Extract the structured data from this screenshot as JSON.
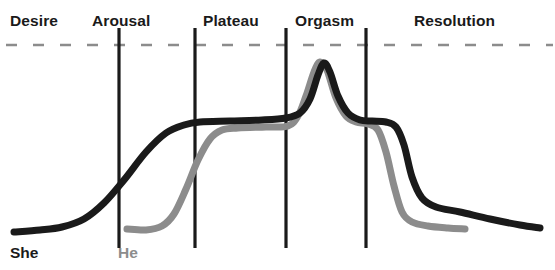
{
  "chart_data": {
    "type": "line",
    "title": "",
    "subtitle": "",
    "xlabel": "",
    "ylabel": "",
    "grid": false,
    "legend_position": "bottom-left",
    "phases": [
      {
        "name": "Desire",
        "label_x": 10,
        "label_y": 13,
        "boundary_x": null
      },
      {
        "name": "Arousal",
        "label_x": 92,
        "label_y": 13,
        "boundary_x": 119
      },
      {
        "name": "Plateau",
        "label_x": 203,
        "label_y": 13,
        "boundary_x": 195
      },
      {
        "name": "Orgasm",
        "label_x": 295,
        "label_y": 13,
        "boundary_x": 286
      },
      {
        "name": "Resolution",
        "label_x": 414,
        "label_y": 13,
        "boundary_x": 366
      }
    ],
    "dividers_x": [
      119,
      195,
      286,
      366
    ],
    "divider_top_y": 28,
    "divider_bottom_y": 248,
    "threshold_line": {
      "y": 45,
      "x_start": 6,
      "x_end": 553,
      "style": "dashed",
      "color": "#8c8c8c"
    },
    "series": [
      {
        "name": "She",
        "color": "#1a1a1a",
        "label_x": 10,
        "label_y": 245,
        "stroke_width": 7,
        "points": [
          [
            14,
            232
          ],
          [
            40,
            230
          ],
          [
            62,
            227
          ],
          [
            84,
            219
          ],
          [
            104,
            203
          ],
          [
            124,
            180
          ],
          [
            146,
            152
          ],
          [
            166,
            133
          ],
          [
            184,
            125
          ],
          [
            200,
            122
          ],
          [
            230,
            121
          ],
          [
            262,
            120
          ],
          [
            286,
            118
          ],
          [
            300,
            113
          ],
          [
            310,
            99
          ],
          [
            318,
            75
          ],
          [
            324,
            63
          ],
          [
            330,
            72
          ],
          [
            338,
            96
          ],
          [
            348,
            113
          ],
          [
            360,
            120
          ],
          [
            372,
            121
          ],
          [
            386,
            122
          ],
          [
            396,
            127
          ],
          [
            404,
            145
          ],
          [
            412,
            177
          ],
          [
            422,
            198
          ],
          [
            436,
            207
          ],
          [
            460,
            212
          ],
          [
            490,
            219
          ],
          [
            520,
            225
          ],
          [
            540,
            228
          ]
        ]
      },
      {
        "name": "He",
        "color": "#8c8c8c",
        "label_x": 118,
        "label_y": 245,
        "stroke_width": 7,
        "points": [
          [
            127,
            229
          ],
          [
            146,
            230
          ],
          [
            162,
            226
          ],
          [
            174,
            214
          ],
          [
            186,
            189
          ],
          [
            198,
            160
          ],
          [
            210,
            139
          ],
          [
            222,
            130
          ],
          [
            238,
            128
          ],
          [
            266,
            127
          ],
          [
            288,
            126
          ],
          [
            298,
            116
          ],
          [
            306,
            96
          ],
          [
            314,
            72
          ],
          [
            320,
            62
          ],
          [
            327,
            70
          ],
          [
            336,
            98
          ],
          [
            346,
            116
          ],
          [
            356,
            122
          ],
          [
            368,
            124
          ],
          [
            378,
            130
          ],
          [
            386,
            152
          ],
          [
            394,
            186
          ],
          [
            402,
            212
          ],
          [
            412,
            222
          ],
          [
            428,
            226
          ],
          [
            448,
            228
          ],
          [
            465,
            229
          ]
        ]
      }
    ]
  },
  "labels": {
    "desire": "Desire",
    "arousal": "Arousal",
    "plateau": "Plateau",
    "orgasm": "Orgasm",
    "resolution": "Resolution",
    "she": "She",
    "he": "He"
  },
  "colors": {
    "she_line": "#1a1a1a",
    "he_line": "#8c8c8c",
    "divider": "#1a1a1a",
    "threshold": "#8c8c8c",
    "background": "#ffffff",
    "text": "#1a1a1a"
  }
}
